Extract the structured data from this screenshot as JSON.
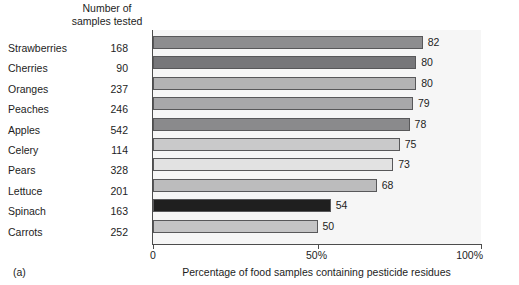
{
  "figure": {
    "panel_tag": "(a)",
    "samples_header": "Number of\nsamples tested"
  },
  "chart_data": {
    "type": "bar",
    "orientation": "horizontal",
    "title": "",
    "xlabel": "Percentage of food samples containing pesticide residues",
    "ylabel": "",
    "xlim": [
      0,
      100
    ],
    "grid": false,
    "legend": "none",
    "xticks": [
      0,
      50,
      100
    ],
    "xtick_labels": [
      "0",
      "50%",
      "100%"
    ],
    "categories": [
      "Strawberries",
      "Cherries",
      "Oranges",
      "Peaches",
      "Apples",
      "Celery",
      "Pears",
      "Lettuce",
      "Spinach",
      "Carrots"
    ],
    "values": [
      82,
      80,
      80,
      79,
      78,
      75,
      73,
      68,
      54,
      50
    ],
    "value_labels": [
      "82",
      "80",
      "80",
      "79",
      "78",
      "75",
      "73",
      "68",
      "54",
      "50"
    ],
    "samples_tested": [
      168,
      90,
      237,
      246,
      542,
      114,
      328,
      201,
      163,
      252
    ],
    "samples_tested_labels": [
      "168",
      "90",
      "237",
      "246",
      "542",
      "114",
      "328",
      "201",
      "163",
      "252"
    ],
    "bar_colors": [
      "#8d8d8f",
      "#77777a",
      "#b3b3b4",
      "#a8a8aa",
      "#8a8a8c",
      "#c9c9ca",
      "#e2e2e2",
      "#bcbcbd",
      "#1f1f1f",
      "#c4c4c5"
    ],
    "bar_outline_color": "#58585a",
    "plot_background": "#f6f6f6",
    "axis_color": "#4d4d4d"
  }
}
